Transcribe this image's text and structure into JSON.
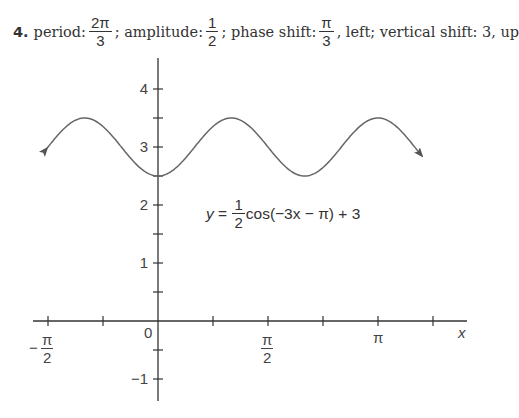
{
  "problem": {
    "number": "4.",
    "period_label": "period:",
    "period_num": "2π",
    "period_den": "3",
    "sep1": ";",
    "amplitude_label": "amplitude:",
    "amplitude_num": "1",
    "amplitude_den": "2",
    "sep2": ";",
    "phase_label": "phase shift:",
    "phase_num": "π",
    "phase_den": "3",
    "tail": ", left; vertical shift: 3, up"
  },
  "equation": {
    "lhs": "y",
    "eq": "=",
    "coef_num": "1",
    "coef_den": "2",
    "rhs": "cos(−3x − π) + 3"
  },
  "chart_data": {
    "type": "line",
    "title": "",
    "function": "y = (1/2)cos(-3x - π) + 3",
    "params": {
      "amplitude": 0.5,
      "b": -3,
      "c": -3.14159265,
      "d": 3
    },
    "xlabel": "x",
    "ylabel": "",
    "xlim": [
      -1.585,
      3.77
    ],
    "ylim": [
      -1.4,
      4.5
    ],
    "x_ticks": [
      {
        "value": -1.5708,
        "label_num": "π",
        "label_den": "2",
        "neg": true
      },
      {
        "value": -0.7854,
        "label": ""
      },
      {
        "value": 0,
        "label": "0"
      },
      {
        "value": 0.7854,
        "label": ""
      },
      {
        "value": 1.5708,
        "label_num": "π",
        "label_den": "2",
        "neg": false
      },
      {
        "value": 2.3562,
        "label": ""
      },
      {
        "value": 3.1416,
        "label": "π"
      },
      {
        "value": 3.927,
        "label": ""
      }
    ],
    "y_ticks": [
      {
        "value": -1,
        "label": "−1"
      },
      {
        "value": -0.5,
        "label": ""
      },
      {
        "value": 0.5,
        "label": ""
      },
      {
        "value": 1,
        "label": "1"
      },
      {
        "value": 1.5,
        "label": ""
      },
      {
        "value": 2,
        "label": "2"
      },
      {
        "value": 2.5,
        "label": ""
      },
      {
        "value": 3,
        "label": "3"
      },
      {
        "value": 3.5,
        "label": ""
      },
      {
        "value": 4,
        "label": "4"
      }
    ],
    "key_points": [
      {
        "x": 0,
        "y": 2.5,
        "kind": "min"
      },
      {
        "x": 1.0472,
        "y": 3.5,
        "kind": "max"
      },
      {
        "x": 2.0944,
        "y": 2.5,
        "kind": "min"
      },
      {
        "x": 3.1416,
        "y": 3.5,
        "kind": "max"
      },
      {
        "x": -1.0472,
        "y": 3.5,
        "kind": "max"
      }
    ],
    "arrows_at_ends": true,
    "grid": false,
    "colors": {
      "curve": "#666666",
      "axes": "#333333"
    }
  }
}
